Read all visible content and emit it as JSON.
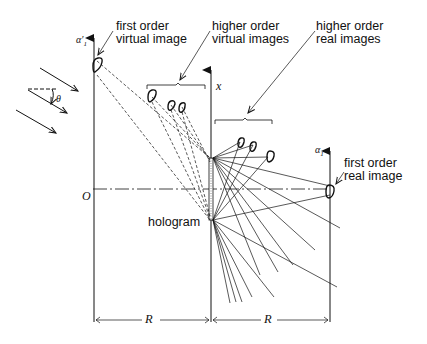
{
  "diagram": {
    "labels": {
      "first_order_virtual_line1": "first order",
      "first_order_virtual_line2": "virtual image",
      "higher_order_virtual_line1": "higher order",
      "higher_order_virtual_line2": "virtual images",
      "higher_order_real_line1": "higher order",
      "higher_order_real_line2": "real images",
      "first_order_real_line1": "first order",
      "first_order_real_line2": "real image",
      "hologram": "hologram",
      "origin": "O",
      "x_axis": "x",
      "theta": "θ",
      "alpha_virtual": "α′",
      "alpha_virtual_sub": "1",
      "alpha_real": "α",
      "alpha_real_sub": "1",
      "distance_left": "R",
      "distance_right": "R"
    },
    "colors": {
      "ink": "#111111",
      "background": "#ffffff"
    }
  }
}
